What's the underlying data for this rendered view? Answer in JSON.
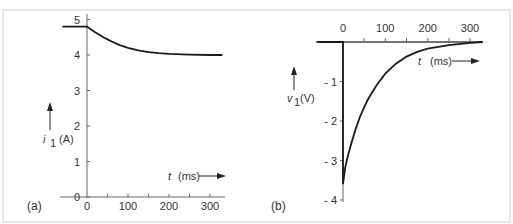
{
  "chart_data": [
    {
      "type": "line",
      "panel": "(a)",
      "title": "",
      "xlabel": "t  (ms)",
      "ylabel": "i 1 (A)",
      "x_ticks": [
        0,
        100,
        200,
        300
      ],
      "x_minor_ticks": [
        50,
        150,
        250
      ],
      "y_ticks": [
        0,
        1,
        2,
        3,
        4,
        5
      ],
      "xlim": [
        -60,
        330
      ],
      "ylim": [
        0,
        5.2
      ],
      "grid": false,
      "series": [
        {
          "name": "i1",
          "x": [
            -60,
            0,
            10,
            20,
            30,
            40,
            50,
            60,
            80,
            100,
            125,
            150,
            175,
            200,
            250,
            300,
            330
          ],
          "y": [
            4.8,
            4.8,
            4.72,
            4.64,
            4.57,
            4.5,
            4.44,
            4.38,
            4.28,
            4.2,
            4.13,
            4.08,
            4.05,
            4.03,
            4.01,
            4.0,
            4.0
          ]
        }
      ]
    },
    {
      "type": "line",
      "panel": "(b)",
      "title": "",
      "xlabel": "t  (ms)",
      "ylabel": "v 1 (V)",
      "x_ticks": [
        0,
        100,
        200,
        300
      ],
      "x_minor_ticks": [
        50,
        150,
        250
      ],
      "y_ticks": [
        -1,
        -2,
        -3,
        -4
      ],
      "xlim": [
        -60,
        330
      ],
      "ylim": [
        -4,
        0
      ],
      "grid": false,
      "series": [
        {
          "name": "v1",
          "x": [
            -60,
            0,
            0,
            5,
            10,
            20,
            30,
            40,
            50,
            60,
            80,
            100,
            125,
            150,
            175,
            200,
            250,
            300,
            330
          ],
          "y": [
            0,
            0,
            -3.6,
            -3.2,
            -2.95,
            -2.55,
            -2.2,
            -1.9,
            -1.65,
            -1.43,
            -1.08,
            -0.8,
            -0.55,
            -0.37,
            -0.25,
            -0.17,
            -0.08,
            -0.02,
            0
          ]
        }
      ]
    }
  ],
  "panels": {
    "a": {
      "label": "(a)",
      "y_tick_labels": [
        "0",
        "1",
        "2",
        "3",
        "4",
        "5"
      ],
      "x_tick_labels": [
        "0",
        "100",
        "200",
        "300"
      ],
      "y_axis_symbol": "i",
      "y_axis_subscript": "1",
      "y_axis_unit": "(A)",
      "x_axis_symbol": "t",
      "x_axis_unit": "(ms)"
    },
    "b": {
      "label": "(b)",
      "y_tick_labels": [
        "- 1",
        "- 2",
        "- 3",
        "- 4"
      ],
      "x_tick_labels": [
        "0",
        "100",
        "200",
        "300"
      ],
      "y_axis_symbol": "v",
      "y_axis_subscript": "1",
      "y_axis_unit": "(V)",
      "x_axis_symbol": "t",
      "x_axis_unit": "(ms)"
    }
  },
  "colors": {
    "curve": "#1a1a1a",
    "axis": "#555555",
    "frame": "#cccccc",
    "text": "#333333"
  }
}
